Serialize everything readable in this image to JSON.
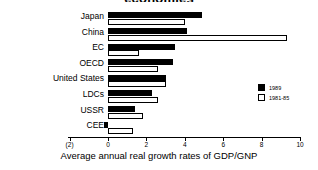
{
  "chart_data": {
    "type": "bar",
    "orientation": "horizontal",
    "title": "economies",
    "xlabel": "Average annual real growth rates of GDP/GNP",
    "ylabel": "",
    "categories": [
      "Japan",
      "China",
      "EC",
      "OECD",
      "United States",
      "LDCs",
      "USSR",
      "CEE"
    ],
    "series": [
      {
        "name": "1989",
        "color": "#000000",
        "values": [
          4.9,
          4.1,
          3.5,
          3.4,
          3.0,
          2.3,
          1.4,
          -0.2
        ]
      },
      {
        "name": "1981-85",
        "color": "#ffffff",
        "values": [
          4.0,
          9.3,
          1.6,
          2.6,
          3.0,
          2.6,
          1.8,
          1.3
        ]
      }
    ],
    "xlim": [
      -2,
      10
    ],
    "xticks": [
      -2,
      0,
      2,
      4,
      6,
      8,
      10
    ],
    "xtick_labels": [
      "(2)",
      "0",
      "2",
      "4",
      "6",
      "8",
      "10"
    ],
    "grid": false,
    "legend_position": "right"
  },
  "legend": {
    "items": [
      {
        "label": "1989",
        "swatch": "#000000"
      },
      {
        "label": "1981-85",
        "swatch": "#ffffff"
      }
    ]
  }
}
